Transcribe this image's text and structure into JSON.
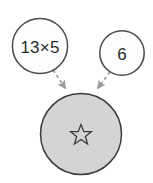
{
  "diagram": {
    "type": "multiplication-bubble-diagram",
    "canvas": {
      "width": 153,
      "height": 183,
      "background": "#ffffff"
    },
    "colors": {
      "operand_fill": "#fdfdfd",
      "operand_stroke": "#4a4a4a",
      "result_fill": "#d4d4d4",
      "result_stroke": "#3c3c3c",
      "arrow": "#9a9a9a",
      "text": "#2b2b2b",
      "star_stroke": "#3a3a3a"
    },
    "nodes": [
      {
        "id": "operand-left",
        "name": "operand-circle-left",
        "label": "13×5",
        "shape": "circle",
        "cx": 40,
        "cy": 46,
        "r": 28,
        "fill": "#fdfdfd",
        "stroke": "#4a4a4a"
      },
      {
        "id": "operand-right",
        "name": "operand-circle-right",
        "label": "6",
        "shape": "circle",
        "cx": 122,
        "cy": 53,
        "r": 22,
        "fill": "#fdfdfd",
        "stroke": "#4a4a4a"
      },
      {
        "id": "result",
        "name": "result-circle",
        "label": "☆",
        "label_kind": "star-outline",
        "shape": "circle",
        "cx": 81,
        "cy": 134,
        "r": 41,
        "fill": "#d4d4d4",
        "stroke": "#3c3c3c"
      }
    ],
    "arrows": [
      {
        "id": "arrow-left",
        "name": "arrow-left-to-result",
        "from": "operand-left",
        "to": "result",
        "style": "dashed",
        "color": "#9a9a9a",
        "x1": 53,
        "y1": 70,
        "x2": 65,
        "y2": 88
      },
      {
        "id": "arrow-right",
        "name": "arrow-right-to-result",
        "from": "operand-right",
        "to": "result",
        "style": "dashed",
        "color": "#9a9a9a",
        "x1": 110,
        "y1": 72,
        "x2": 98,
        "y2": 88
      }
    ]
  }
}
